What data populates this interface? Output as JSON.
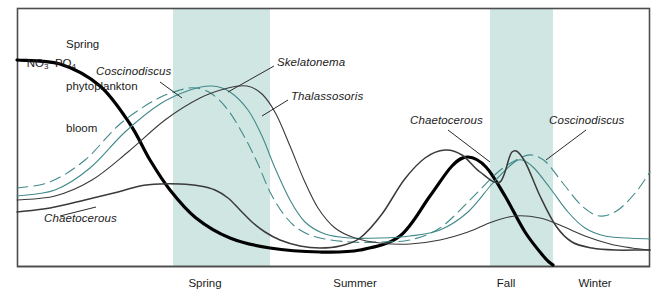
{
  "figure": {
    "title_visible": false,
    "frame_color": "#4d4d4d",
    "background": "#ffffff"
  },
  "colors": {
    "band_fill": "#cfe6e3",
    "teal_line": "#41898a",
    "dark_line": "#3a3a3a",
    "heavy_line": "#000000",
    "text": "#1b1b1b"
  },
  "annotations": {
    "nutrients": "NO₃ PO₄",
    "nutrients_parts": {
      "first": "NO",
      "first_sub": "3",
      "second": "PO",
      "second_sub": "4"
    },
    "bloom_line1": "Spring",
    "bloom_line2": "phytoplankton",
    "bloom_line3": "bloom",
    "coscinodiscus_spring": "Coscinodiscus",
    "skelatonema": "Skelatonema",
    "thalassosoris": "Thalassosoris",
    "chaetocerous_left": "Chaetocerous",
    "chaetocerous_fall": "Chaetocerous",
    "coscinodiscus_fall": "Coscinodiscus"
  },
  "seasons": [
    {
      "label": "Spring",
      "shaded": true,
      "x_start": 173,
      "x_end": 270,
      "label_x": 205,
      "label_y": 283
    },
    {
      "label": "Summer",
      "shaded": false,
      "x_start": 270,
      "x_end": 490,
      "label_x": 355,
      "label_y": 283
    },
    {
      "label": "Fall",
      "shaded": true,
      "x_start": 490,
      "x_end": 553,
      "label_x": 506,
      "label_y": 283
    },
    {
      "label": "Winter",
      "shaded": false,
      "x_start": 553,
      "x_end": 650,
      "label_x": 595,
      "label_y": 283
    }
  ],
  "chart_data": {
    "type": "line",
    "xlabel": "Season",
    "ylabel": "Relative abundance / concentration",
    "grid": false,
    "legend": "inline-annotations",
    "x_axis": {
      "tick_labels": [
        "Spring",
        "Summer",
        "Fall",
        "Winter"
      ],
      "shaded_bands": [
        "Spring",
        "Fall"
      ]
    },
    "y_axis": {
      "tick_labels": [],
      "range_note": "unlabeled relative scale, higher is up"
    },
    "series": [
      {
        "name": "NO3 PO4",
        "style": "solid",
        "weight": "heavy",
        "color": "#000000",
        "description": "Nutrient concentration: high in winter/early spring, crashes during spring bloom, stays low through summer, large peak in early fall, then falls off at end of fall",
        "points": [
          [
            17,
            60
          ],
          [
            60,
            64
          ],
          [
            100,
            86
          ],
          [
            130,
            124
          ],
          [
            150,
            160
          ],
          [
            170,
            190
          ],
          [
            196,
            218
          ],
          [
            230,
            238
          ],
          [
            270,
            248
          ],
          [
            320,
            252
          ],
          [
            360,
            250
          ],
          [
            400,
            236
          ],
          [
            430,
            196
          ],
          [
            452,
            166
          ],
          [
            468,
            157
          ],
          [
            486,
            167
          ],
          [
            505,
            196
          ],
          [
            525,
            232
          ],
          [
            545,
            258
          ],
          [
            553,
            265
          ]
        ]
      },
      {
        "name": "Coscinodiscus",
        "style": "dashed",
        "weight": "thin",
        "color": "#41898a",
        "description": "Dashed teal: rises from low winter base to first spring peak (earliest bloomer), declines through summer to near-baseline, second peak in fall, dips in winter then rises at right edge",
        "points": [
          [
            17,
            188
          ],
          [
            50,
            182
          ],
          [
            85,
            160
          ],
          [
            120,
            124
          ],
          [
            155,
            100
          ],
          [
            180,
            90
          ],
          [
            196,
            88
          ],
          [
            212,
            94
          ],
          [
            228,
            110
          ],
          [
            244,
            136
          ],
          [
            258,
            164
          ],
          [
            270,
            192
          ],
          [
            285,
            216
          ],
          [
            300,
            230
          ],
          [
            320,
            238
          ],
          [
            350,
            242
          ],
          [
            380,
            242
          ],
          [
            410,
            240
          ],
          [
            440,
            228
          ],
          [
            470,
            200
          ],
          [
            498,
            172
          ],
          [
            520,
            158
          ],
          [
            532,
            155
          ],
          [
            546,
            162
          ],
          [
            562,
            182
          ],
          [
            582,
            206
          ],
          [
            600,
            216
          ],
          [
            618,
            210
          ],
          [
            636,
            192
          ],
          [
            650,
            172
          ]
        ]
      },
      {
        "name": "Skelatonema",
        "style": "solid",
        "weight": "thin",
        "color": "#41898a",
        "description": "Solid teal: second spring peak just after Coscinodiscus, declines through summer to a long flat baseline, modest fall rise, flat into winter",
        "points": [
          [
            17,
            196
          ],
          [
            55,
            190
          ],
          [
            90,
            168
          ],
          [
            125,
            132
          ],
          [
            160,
            104
          ],
          [
            190,
            90
          ],
          [
            212,
            86
          ],
          [
            230,
            92
          ],
          [
            248,
            110
          ],
          [
            262,
            136
          ],
          [
            275,
            168
          ],
          [
            290,
            200
          ],
          [
            305,
            222
          ],
          [
            325,
            234
          ],
          [
            350,
            238
          ],
          [
            380,
            238
          ],
          [
            410,
            236
          ],
          [
            440,
            230
          ],
          [
            468,
            212
          ],
          [
            492,
            184
          ],
          [
            512,
            164
          ],
          [
            522,
            160
          ],
          [
            534,
            168
          ],
          [
            550,
            188
          ],
          [
            568,
            212
          ],
          [
            585,
            228
          ],
          [
            605,
            236
          ],
          [
            628,
            238
          ],
          [
            650,
            239
          ]
        ]
      },
      {
        "name": "Thalassosoris",
        "style": "solid",
        "weight": "thin",
        "color": "#3a3a3a",
        "description": "Thin dark: latest spring peak of the three bloom species, broad decline through summer, small fall shoulder, flat into winter",
        "points": [
          [
            17,
            200
          ],
          [
            55,
            196
          ],
          [
            92,
            180
          ],
          [
            128,
            152
          ],
          [
            165,
            120
          ],
          [
            200,
            98
          ],
          [
            228,
            88
          ],
          [
            247,
            86
          ],
          [
            262,
            94
          ],
          [
            276,
            114
          ],
          [
            290,
            146
          ],
          [
            304,
            180
          ],
          [
            318,
            208
          ],
          [
            335,
            228
          ],
          [
            355,
            238
          ],
          [
            380,
            243
          ],
          [
            410,
            244
          ],
          [
            440,
            240
          ],
          [
            468,
            232
          ],
          [
            492,
            222
          ],
          [
            515,
            216
          ],
          [
            540,
            218
          ],
          [
            562,
            226
          ],
          [
            585,
            236
          ],
          [
            610,
            244
          ],
          [
            632,
            248
          ],
          [
            650,
            250
          ]
        ]
      },
      {
        "name": "Chaetocerous",
        "style": "solid",
        "weight": "medium",
        "color": "#3a3a3a",
        "description": "Dark line: low broad rise in spring (flat hump), dips to summer minimum, then large sharp fall peak, dips and flattens through winter",
        "points": [
          [
            17,
            212
          ],
          [
            50,
            208
          ],
          [
            85,
            200
          ],
          [
            118,
            192
          ],
          [
            140,
            186
          ],
          [
            160,
            184
          ],
          [
            180,
            184
          ],
          [
            200,
            186
          ],
          [
            215,
            190
          ],
          [
            228,
            198
          ],
          [
            240,
            210
          ],
          [
            252,
            222
          ],
          [
            265,
            232
          ],
          [
            280,
            240
          ],
          [
            300,
            246
          ],
          [
            320,
            248
          ],
          [
            340,
            246
          ],
          [
            360,
            238
          ],
          [
            382,
            214
          ],
          [
            404,
            180
          ],
          [
            425,
            158
          ],
          [
            445,
            150
          ],
          [
            462,
            155
          ],
          [
            480,
            172
          ],
          [
            500,
            182
          ],
          [
            512,
            152
          ],
          [
            524,
            160
          ],
          [
            540,
            196
          ],
          [
            556,
            226
          ],
          [
            572,
            242
          ],
          [
            592,
            248
          ],
          [
            615,
            250
          ],
          [
            640,
            250
          ],
          [
            650,
            250
          ]
        ]
      }
    ],
    "leader_lines": [
      {
        "from_label": "Coscinodiscus",
        "x1": 160,
        "y1": 82,
        "x2": 182,
        "y2": 98
      },
      {
        "from_label": "Skelatonema",
        "x1": 274,
        "y1": 66,
        "x2": 228,
        "y2": 92
      },
      {
        "from_label": "Thalassosoris",
        "x1": 288,
        "y1": 100,
        "x2": 262,
        "y2": 116
      },
      {
        "from_label": "Chaetocerous-left",
        "x1": 60,
        "y1": 216,
        "x2": 96,
        "y2": 207
      },
      {
        "from_label": "Chaetocerous-fall",
        "x1": 448,
        "y1": 130,
        "x2": 490,
        "y2": 162
      },
      {
        "from_label": "Coscinodiscus-fall",
        "x1": 586,
        "y1": 130,
        "x2": 546,
        "y2": 160
      }
    ]
  }
}
